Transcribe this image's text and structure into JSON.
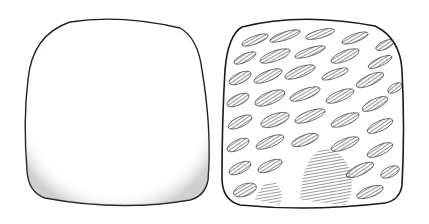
{
  "figure": {
    "specimens": [
      {
        "id": "left",
        "surface": "smooth",
        "outline_color": "#1a1a1a",
        "fill": "#ffffff"
      },
      {
        "id": "right",
        "surface": "textured",
        "texture": "elongated diagonal pits with hatching",
        "outline_color": "#1a1a1a",
        "ink_color": "#111111"
      }
    ],
    "background": "#ffffff"
  }
}
